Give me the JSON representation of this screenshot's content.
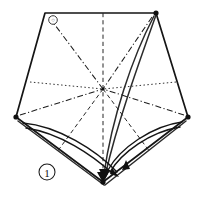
{
  "figure": {
    "step_label": "1",
    "background_color": "#ffffff",
    "ink_color": "#151515",
    "canvas": {
      "width": 203,
      "height": 197
    }
  },
  "geometry": {
    "outline_points": "45,13 156,13 188,117 103,182 16,117",
    "vertices": [
      {
        "name": "top-left",
        "x": 45,
        "y": 13,
        "marker": "ring"
      },
      {
        "name": "top-right",
        "x": 156,
        "y": 13,
        "marker": "dot"
      },
      {
        "name": "right",
        "x": 188,
        "y": 117,
        "marker": "dot"
      },
      {
        "name": "bottom",
        "x": 103,
        "y": 182,
        "marker": "dot"
      },
      {
        "name": "left",
        "x": 16,
        "y": 117,
        "marker": "dot"
      }
    ],
    "center": {
      "x": 103,
      "y": 89
    }
  },
  "creases": [
    {
      "name": "crease-center-to-top",
      "style": "dash",
      "d": "M 103,13 L 103,182"
    },
    {
      "name": "crease-center-to-top-left",
      "style": "dashdot",
      "d": "M 49,17 L 103,89"
    },
    {
      "name": "crease-center-to-top-right",
      "style": "dashdot",
      "d": "M 152,17 L 103,89"
    },
    {
      "name": "crease-center-to-left",
      "style": "dashdot",
      "d": "M 20,115 L 103,89"
    },
    {
      "name": "crease-center-to-right",
      "style": "dashdot",
      "d": "M 184,115 L 103,89"
    },
    {
      "name": "crease-center-to-left-edge",
      "style": "dot",
      "d": "M 30,82 L 103,89"
    },
    {
      "name": "crease-center-to-right-edge",
      "style": "dot",
      "d": "M 176,82 L 103,89"
    },
    {
      "name": "crease-center-to-lower-left",
      "style": "dash",
      "d": "M 103,89 L 57,152"
    },
    {
      "name": "crease-center-to-lower-right",
      "style": "dash",
      "d": "M 103,89 L 150,152"
    }
  ],
  "motion_arrows": [
    {
      "name": "fold-arrow-left-outer",
      "label": "left flap to bottom vertex",
      "head_x": 118,
      "head_y": 176,
      "head_angle": 112
    },
    {
      "name": "fold-arrow-left-inner",
      "label": "left crease to bottom",
      "head_x": 103,
      "head_y": 176,
      "head_angle": 90
    },
    {
      "name": "fold-arrow-right-inner",
      "label": "right crease to bottom",
      "head_x": 123,
      "head_y": 170,
      "head_angle": 125
    },
    {
      "name": "fold-arrow-top-right",
      "label": "top-right flap down",
      "head_x": 105,
      "head_y": 178,
      "head_angle": 84
    }
  ],
  "annotations": {
    "step_badge": {
      "name": "step-number-badge",
      "value": "1",
      "x": 47,
      "y": 172,
      "radius": 8
    },
    "corner_marker": {
      "name": "corner-reference-ring",
      "x": 53,
      "y": 20,
      "radius": 4.5
    }
  }
}
